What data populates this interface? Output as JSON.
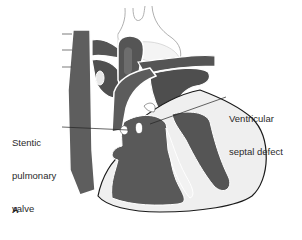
{
  "figure": {
    "panel_letter": "A",
    "labels": [
      {
        "id": "stentic-pulmonary-valve",
        "lines": [
          "Stentic",
          "pulmonary",
          "valve"
        ]
      },
      {
        "id": "ventricular-septal-defect",
        "lines": [
          "Ventricular",
          "septal defect"
        ]
      }
    ]
  },
  "colors": {
    "chamber_fill": "#5a5a5a",
    "vessel_fill": "#666666",
    "myocardium_fill": "#f2f2f2",
    "outline": "#1a1a1a",
    "highlight": "#ffffff",
    "background": "#ffffff"
  }
}
